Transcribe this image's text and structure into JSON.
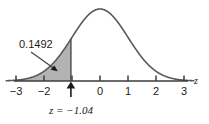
{
  "chart_data": {
    "type": "area",
    "title": "",
    "xlabel": "z",
    "ylabel": "",
    "xlim": [
      -3.35,
      3.35
    ],
    "ylim": [
      0,
      0.42
    ],
    "grid": false,
    "legend": null,
    "curve": {
      "name": "standard normal density",
      "distribution": "normal",
      "mean": 0,
      "sd": 1,
      "stroke_color": "#595959"
    },
    "x_ticks": [
      -3,
      -2,
      -1,
      0,
      1,
      2,
      3
    ],
    "x_tick_labels": [
      "−3",
      "−2",
      "",
      "0",
      "1",
      "2",
      "3"
    ],
    "shaded_region": {
      "from": -3.35,
      "to": -1.04,
      "fill_color": "#b3b3b3",
      "area_value": "0.1492"
    },
    "annotations": [
      {
        "name": "area-label",
        "text": "0.1492",
        "x": -2.55,
        "y": 0.295,
        "points_to": {
          "x": -1.55,
          "y": 0.075
        }
      },
      {
        "name": "z-marker-label",
        "text": "z = −1.04",
        "x": -1.04,
        "y": -0.12,
        "marker_x": -1.04
      }
    ]
  },
  "figure": {
    "axis_label": "z",
    "area_label": "0.1492",
    "z_marker_label": "z = −1.04",
    "tick_minus3": "−3",
    "tick_minus2": "−2",
    "tick_zero": "0",
    "tick_one": "1",
    "tick_two": "2",
    "tick_three": "3"
  },
  "colors": {
    "background": "#ffffff",
    "curve": "#595959",
    "shade": "#b3b3b3",
    "axis": "#3d3d3d",
    "text": "#1a1a1a"
  }
}
